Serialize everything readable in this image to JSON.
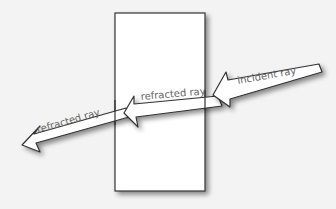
{
  "diagram": {
    "colors": {
      "background": "#f3f3f3",
      "block_fill": "#ffffff",
      "stroke": "#333333",
      "label": "#666666"
    },
    "block": {
      "label": ""
    },
    "arrows": [
      {
        "id": "incident",
        "label": "incident ray"
      },
      {
        "id": "refracted-inside",
        "label": "refracted ray"
      },
      {
        "id": "refracted-exit",
        "label": "refracted ray"
      }
    ]
  }
}
